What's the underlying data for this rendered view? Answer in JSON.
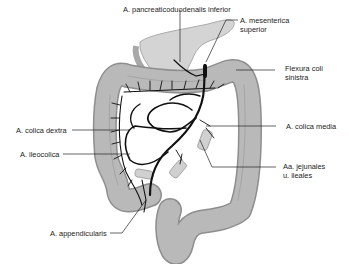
{
  "diagram": {
    "colors": {
      "colon_fill": "#b9b9b9",
      "colon_stroke": "#8e8e8e",
      "pancreas_fill": "#d4d4d4",
      "artery": "#111111",
      "leader": "#222222",
      "text": "#222222",
      "background": "#ffffff"
    },
    "labels": {
      "pancreaticoduodenalis": "A. pancreaticoduodenalis inferior",
      "mesenterica_1": "A. mesenterica",
      "mesenterica_2": "superior",
      "flexura_1": "Flexura coli",
      "flexura_2": "sinistra",
      "colica_dextra": "A. colica dextra",
      "colica_media": "A. colica media",
      "ileocolica": "A. ileocolica",
      "jejunales_1": "Aa. jejunales",
      "jejunales_2": "u. ileales",
      "appendicularis": "A. appendicularis"
    }
  }
}
